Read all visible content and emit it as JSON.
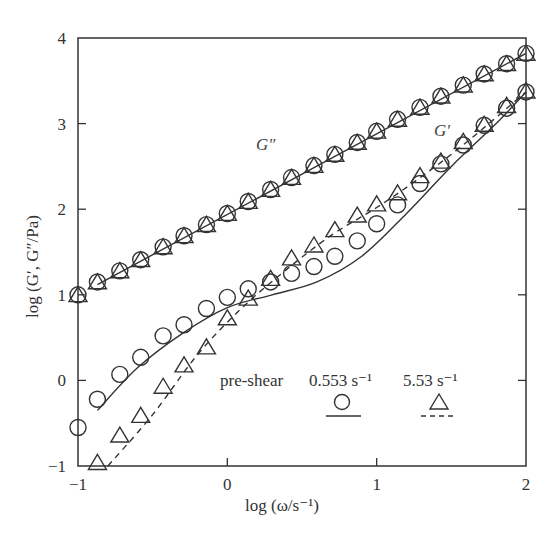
{
  "chart_data": {
    "type": "scatter",
    "title": "",
    "xlabel": "log (ω/s⁻¹)",
    "ylabel": "log (G′, G″/Pa)",
    "xlim": [
      -1,
      2
    ],
    "ylim": [
      -1,
      4
    ],
    "xticks": [
      -1,
      0,
      1,
      2
    ],
    "yticks": [
      -1,
      0,
      1,
      2,
      3,
      4
    ],
    "xtick_labels": [
      "−1",
      "0",
      "1",
      "2"
    ],
    "ytick_labels": [
      "−1",
      "0",
      "1",
      "2",
      "3",
      "4"
    ],
    "grid": false,
    "legend": {
      "position": "lower right",
      "title": "pre-shear",
      "entries": [
        {
          "label": "0.553 s⁻¹",
          "marker": "circle",
          "line": "solid"
        },
        {
          "label": "5.53 s⁻¹",
          "marker": "triangle",
          "line": "dashed"
        }
      ]
    },
    "annotations": [
      {
        "text": "G″",
        "x": 0.72,
        "y": 2.55
      },
      {
        "text": "G′",
        "x": 1.72,
        "y": 2.72
      }
    ],
    "series": [
      {
        "name": "G″ pre-shear 0.553 s⁻¹",
        "marker": "circle",
        "x": [
          -1.0,
          -0.87,
          -0.72,
          -0.58,
          -0.43,
          -0.29,
          -0.14,
          0.0,
          0.14,
          0.29,
          0.43,
          0.58,
          0.72,
          0.87,
          1.0,
          1.14,
          1.29,
          1.43,
          1.58,
          1.72,
          1.87,
          2.0
        ],
        "y": [
          1.0,
          1.15,
          1.28,
          1.41,
          1.56,
          1.69,
          1.82,
          1.95,
          2.09,
          2.23,
          2.37,
          2.51,
          2.64,
          2.78,
          2.91,
          3.05,
          3.19,
          3.32,
          3.45,
          3.58,
          3.7,
          3.82
        ]
      },
      {
        "name": "G″ pre-shear 5.53 s⁻¹",
        "marker": "triangle",
        "x": [
          -1.0,
          -0.87,
          -0.72,
          -0.58,
          -0.43,
          -0.29,
          -0.14,
          0.0,
          0.14,
          0.29,
          0.43,
          0.58,
          0.72,
          0.87,
          1.0,
          1.14,
          1.29,
          1.43,
          1.58,
          1.72,
          1.87,
          2.0
        ],
        "y": [
          0.99,
          1.14,
          1.27,
          1.4,
          1.55,
          1.68,
          1.81,
          1.94,
          2.08,
          2.22,
          2.36,
          2.5,
          2.63,
          2.77,
          2.9,
          3.04,
          3.18,
          3.31,
          3.44,
          3.57,
          3.69,
          3.81
        ]
      },
      {
        "name": "G′ pre-shear 0.553 s⁻¹",
        "marker": "circle",
        "x": [
          -1.0,
          -0.87,
          -0.72,
          -0.58,
          -0.43,
          -0.29,
          -0.14,
          0.0,
          0.14,
          0.29,
          0.43,
          0.58,
          0.72,
          0.87,
          1.0,
          1.14,
          1.29,
          1.43,
          1.58,
          1.72,
          1.87,
          2.0
        ],
        "y": [
          -0.55,
          -0.22,
          0.07,
          0.27,
          0.52,
          0.65,
          0.84,
          0.97,
          1.07,
          1.15,
          1.25,
          1.33,
          1.45,
          1.63,
          1.83,
          2.05,
          2.3,
          2.53,
          2.75,
          2.98,
          3.18,
          3.37
        ]
      },
      {
        "name": "G′ pre-shear 5.53 s⁻¹",
        "marker": "triangle",
        "x": [
          -0.87,
          -0.72,
          -0.58,
          -0.43,
          -0.29,
          -0.14,
          0.0,
          0.14,
          0.29,
          0.43,
          0.58,
          0.72,
          0.87,
          1.0,
          1.14,
          1.29,
          1.43,
          1.58,
          1.72,
          1.87,
          2.0
        ],
        "y": [
          -0.97,
          -0.65,
          -0.42,
          -0.08,
          0.17,
          0.38,
          0.72,
          0.95,
          1.18,
          1.42,
          1.57,
          1.75,
          1.92,
          2.05,
          2.18,
          2.38,
          2.55,
          2.78,
          2.98,
          3.2,
          3.37
        ]
      },
      {
        "name": "fit G″ (solid)",
        "line": "solid",
        "x": [
          -0.87,
          2.0
        ],
        "y": [
          1.12,
          3.82
        ]
      },
      {
        "name": "fit G′ 0.553 s⁻¹ (solid)",
        "line": "solid",
        "x": [
          -0.87,
          -0.6,
          -0.3,
          0.0,
          0.3,
          0.6,
          0.9,
          1.2,
          1.5,
          1.8,
          2.0
        ],
        "y": [
          -0.35,
          0.15,
          0.55,
          0.85,
          1.0,
          1.15,
          1.45,
          1.95,
          2.5,
          3.0,
          3.37
        ]
      },
      {
        "name": "fit G′ 5.53 s⁻¹ (dashed)",
        "line": "dashed",
        "x": [
          -0.8,
          -0.5,
          -0.2,
          0.1,
          0.4,
          0.7,
          1.0,
          1.3,
          1.6,
          2.0
        ],
        "y": [
          -1.0,
          -0.4,
          0.3,
          0.85,
          1.3,
          1.7,
          2.02,
          2.38,
          2.78,
          3.37
        ]
      }
    ]
  },
  "labels": {
    "xlabel": "log (ω/s⁻¹)",
    "ylabel": "log (G′, G″/Pa)",
    "legend_title": "pre-shear",
    "legend_1": "0.553 s⁻¹",
    "legend_2": "5.53 s⁻¹",
    "g2": "G″",
    "g1": "G′"
  }
}
